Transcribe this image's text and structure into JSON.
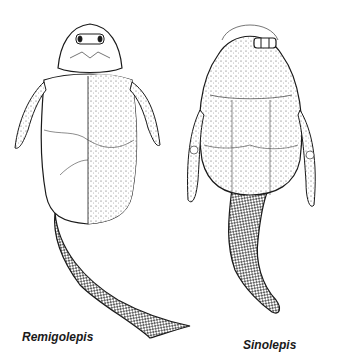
{
  "figure": {
    "specimens": [
      {
        "name": "Remigolepis",
        "label_pos": [
          22,
          330
        ]
      },
      {
        "name": "Sinolepis",
        "label_pos": [
          243,
          338
        ]
      }
    ],
    "colors": {
      "ink": "#1a1a1a",
      "paper": "#ffffff",
      "stipple": "#555555"
    }
  }
}
